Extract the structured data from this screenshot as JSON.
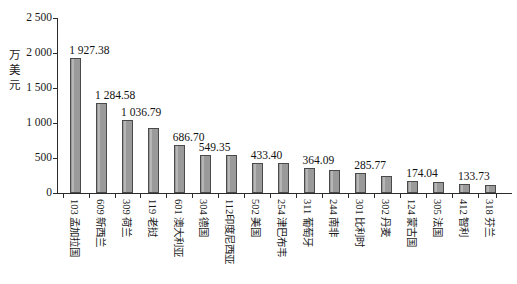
{
  "chart_data": {
    "type": "bar",
    "title": "",
    "xlabel": "",
    "ylabel": "万美元",
    "ylabel_chars": [
      "万",
      "美",
      "元"
    ],
    "ylim": [
      0,
      2500
    ],
    "yticks": [
      0,
      500,
      1000,
      1500,
      2000,
      2500
    ],
    "ytick_labels": [
      "0",
      "500",
      "1 000",
      "1 500",
      "2 000",
      "2 500"
    ],
    "grid": false,
    "legend": null,
    "bar_color": "#9a9a9a",
    "bar_border_color": "#4a4a4a",
    "axis_color": "#2b2b2b",
    "categories": [
      "103 孟加拉国",
      "609 新西兰",
      "309 荷兰",
      "119 老挝",
      "601 澳大利亚",
      "304 德国",
      "112印度尼西亚",
      "502 美国",
      "254 津巴布韦",
      "311 葡萄牙",
      "244 南非",
      "301 比利时",
      "302 丹麦",
      "124 蒙古国",
      "305 法国",
      "412 智利",
      "318 芬兰"
    ],
    "values": [
      1927.38,
      1284.58,
      1036.79,
      933.0,
      686.7,
      549.35,
      549.0,
      433.4,
      433.0,
      364.09,
      330.0,
      285.77,
      243.0,
      174.04,
      155.0,
      133.73,
      120.0
    ],
    "value_labels": [
      "1 927.38",
      "1 284.58",
      "1 036.79",
      "",
      "686.70",
      "549.35",
      "",
      "433.40",
      "",
      "364.09",
      "",
      "285.77",
      "",
      "174.04",
      "",
      "133.73",
      ""
    ]
  }
}
